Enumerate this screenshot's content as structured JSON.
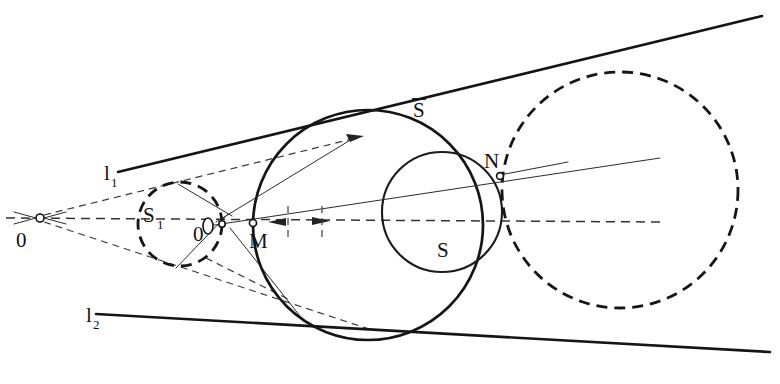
{
  "figure": {
    "kind": "geometric-construction",
    "background_color": "#ffffff",
    "ink_color": "#151515",
    "width": 780,
    "height": 384
  },
  "labels": {
    "apex": {
      "text": "0",
      "x": 16,
      "y": 247
    },
    "line1": {
      "base": "l",
      "sub": "1",
      "x": 104,
      "y": 180
    },
    "line2": {
      "base": "l",
      "sub": "2",
      "x": 86,
      "y": 322
    },
    "circle_s1": {
      "base": "S",
      "sub": "1",
      "x": 143,
      "y": 222
    },
    "center_oprime": {
      "text": "0",
      "x": 197,
      "y": 240
    },
    "point_m": {
      "text": "M",
      "x": 257,
      "y": 247
    },
    "circle_sbar": {
      "text": "S",
      "overbar": true,
      "x": 413,
      "y": 117
    },
    "point_n": {
      "text": "N",
      "x": 492,
      "y": 167
    },
    "circle_s": {
      "text": "S",
      "x": 440,
      "y": 256
    }
  },
  "geometry": {
    "apex_point": {
      "name": "O",
      "x": 40,
      "y": 218
    },
    "axis": {
      "name": "central-axis",
      "x1": 6,
      "y1": 218,
      "x2": 660,
      "y2": 222
    },
    "tangent_line_1": {
      "name": "l1",
      "x1": 118,
      "y1": 172,
      "x2": 762,
      "y2": 16,
      "style": "solid"
    },
    "tangent_line_2": {
      "name": "l2",
      "x1": 96,
      "y1": 314,
      "x2": 770,
      "y2": 352,
      "style": "solid"
    },
    "circle_s1": {
      "name": "S1",
      "cx": 180,
      "cy": 224,
      "r": 42,
      "style": "dashed"
    },
    "circle_sbar": {
      "name": "S-bar",
      "cx": 368,
      "cy": 225,
      "r": 115,
      "style": "solid"
    },
    "circle_s": {
      "name": "S",
      "cx": 442,
      "cy": 212,
      "r": 60,
      "style": "solid"
    },
    "circle_big_dashed": {
      "name": "big-dashed",
      "cx": 620,
      "cy": 190,
      "r": 118,
      "style": "dashed"
    },
    "point_m": {
      "name": "M",
      "x": 253,
      "y": 224
    },
    "point_n": {
      "name": "N",
      "x": 500,
      "y": 175
    },
    "point_oprime": {
      "name": "O-prime",
      "x": 208,
      "y": 226
    }
  }
}
